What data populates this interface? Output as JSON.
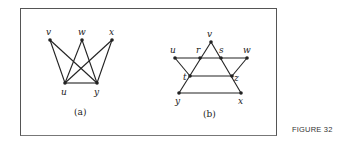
{
  "figure_label": "FIGURE 32",
  "graphs": [
    {
      "caption": "(a)",
      "nodes": [
        {
          "id": "v",
          "label": "v",
          "x": 50,
          "y": 40
        },
        {
          "id": "w",
          "label": "w",
          "x": 82,
          "y": 40
        },
        {
          "id": "x",
          "label": "x",
          "x": 112,
          "y": 40
        },
        {
          "id": "u",
          "label": "u",
          "x": 65,
          "y": 83
        },
        {
          "id": "y",
          "label": "y",
          "x": 97,
          "y": 83
        }
      ],
      "edges": [
        [
          "v",
          "u"
        ],
        [
          "v",
          "y"
        ],
        [
          "w",
          "u"
        ],
        [
          "w",
          "y"
        ],
        [
          "x",
          "u"
        ],
        [
          "x",
          "y"
        ],
        [
          "u",
          "y"
        ]
      ]
    },
    {
      "caption": "(b)",
      "nodes": [
        {
          "id": "v",
          "label": "v",
          "x": 211,
          "y": 42
        },
        {
          "id": "u",
          "label": "u",
          "x": 175,
          "y": 58
        },
        {
          "id": "r",
          "label": "r",
          "x": 200,
          "y": 58
        },
        {
          "id": "s",
          "label": "s",
          "x": 221,
          "y": 58
        },
        {
          "id": "w",
          "label": "w",
          "x": 247,
          "y": 58
        },
        {
          "id": "t",
          "label": "t",
          "x": 190,
          "y": 76
        },
        {
          "id": "z",
          "label": "z",
          "x": 232,
          "y": 76
        },
        {
          "id": "y",
          "label": "y",
          "x": 179,
          "y": 93
        },
        {
          "id": "x",
          "label": "x",
          "x": 241,
          "y": 93
        }
      ],
      "edges": [
        [
          "u",
          "r"
        ],
        [
          "r",
          "s"
        ],
        [
          "s",
          "w"
        ],
        [
          "v",
          "r"
        ],
        [
          "r",
          "t"
        ],
        [
          "t",
          "y"
        ],
        [
          "v",
          "s"
        ],
        [
          "s",
          "z"
        ],
        [
          "z",
          "x"
        ],
        [
          "u",
          "t"
        ],
        [
          "t",
          "z"
        ],
        [
          "w",
          "z"
        ],
        [
          "y",
          "x"
        ]
      ]
    }
  ]
}
